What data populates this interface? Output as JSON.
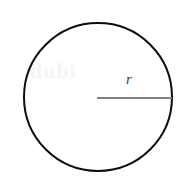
{
  "figure": {
    "name": "circle-with-radius",
    "width": 188,
    "height": 194,
    "background_color": "#ffffff"
  },
  "circle": {
    "center_x": 98,
    "center_y": 97,
    "radius": 74,
    "stroke_color": "#0d0d0d",
    "stroke_width": 2,
    "fill": "none"
  },
  "radius_segment": {
    "label": "r",
    "label_x": 126,
    "label_y": 72,
    "from_x": 97,
    "from_y": 98,
    "to_x": 172,
    "to_y": 98,
    "stroke_color": "#808080",
    "stroke_width": 2
  },
  "watermark": {
    "text": "dubi",
    "color": "#f7f2f3"
  },
  "chart_data": {
    "type": "diagram",
    "title": "",
    "shapes": [
      {
        "shape": "circle",
        "cx": 98,
        "cy": 97,
        "r": 74,
        "stroke": "#0d0d0d",
        "fill": "none"
      },
      {
        "shape": "line",
        "x1": 97,
        "y1": 98,
        "x2": 172,
        "y2": 98,
        "stroke": "#808080",
        "annotation": "r"
      }
    ],
    "annotations": [
      {
        "text": "r",
        "x": 130,
        "y": 82,
        "style": "italic-serif",
        "meaning": "radius of the circle"
      }
    ]
  }
}
